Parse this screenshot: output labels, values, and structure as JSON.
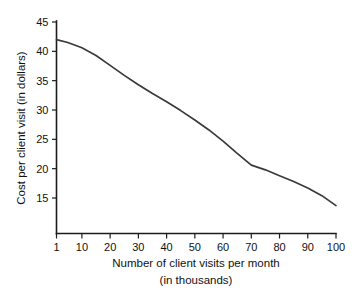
{
  "chart_data": {
    "type": "line",
    "title": "",
    "xlabel": "Number of client visits per month",
    "xlabel_line2": "(in thousands)",
    "ylabel": "Cost per client visit (in dollars)",
    "xlim": [
      1,
      100
    ],
    "ylim": [
      11,
      45
    ],
    "grid": false,
    "legend": false,
    "x_ticks": [
      1,
      10,
      20,
      30,
      40,
      50,
      60,
      70,
      80,
      90,
      100
    ],
    "x_tick_labels": [
      "1",
      "10",
      "20",
      "30",
      "40",
      "50",
      "60",
      "70",
      "80",
      "90",
      "100"
    ],
    "y_ticks": [
      15,
      20,
      25,
      30,
      35,
      40,
      45
    ],
    "y_tick_labels": [
      "15",
      "20",
      "25",
      "30",
      "35",
      "40",
      "45"
    ],
    "series": [
      {
        "name": "Cost per client visit",
        "color": "#3a3a3a",
        "x": [
          1,
          5,
          10,
          15,
          20,
          25,
          30,
          35,
          40,
          45,
          50,
          55,
          60,
          65,
          70,
          75,
          80,
          85,
          90,
          95,
          100
        ],
        "values": [
          42.0,
          41.5,
          40.6,
          39.3,
          37.6,
          35.9,
          34.3,
          32.8,
          31.4,
          29.9,
          28.3,
          26.6,
          24.7,
          22.6,
          20.6,
          19.8,
          18.8,
          17.8,
          16.7,
          15.4,
          13.7
        ]
      }
    ],
    "annotations": []
  },
  "figure": {
    "background_color": "#ffffff",
    "axis_color": "#1c1c1c",
    "text_color": "#111111"
  }
}
